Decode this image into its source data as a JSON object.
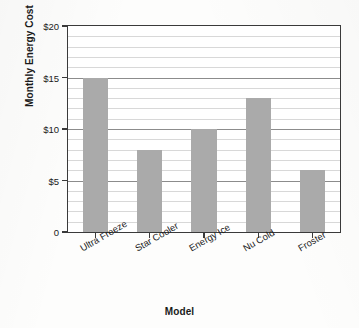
{
  "chart_data": {
    "type": "bar",
    "title": "",
    "xlabel": "Model",
    "ylabel": "Monthly Energy Cost",
    "categories": [
      "Ultra Freeze",
      "Star Cooler",
      "Energy Ice",
      "Nu Cold",
      "Froster"
    ],
    "values": [
      15,
      8,
      10,
      13,
      6
    ],
    "ylim": [
      0,
      20
    ],
    "ytick_values": [
      0,
      5,
      10,
      15,
      20
    ],
    "ytick_labels": [
      "0",
      "$5",
      "$10",
      "$15",
      "$20"
    ],
    "minor_tick_step": 1,
    "grid": true,
    "legend": null,
    "bar_color": "#aaaaaa",
    "axis_color": "#3a3a3a",
    "gridline_color": "#d8d8d8",
    "major_gridline_color": "#8c8c8c"
  }
}
